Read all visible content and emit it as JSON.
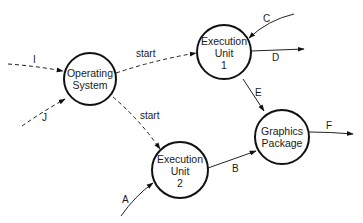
{
  "diagram": {
    "type": "data-flow",
    "colors": {
      "stroke": "#111111",
      "background": "#ffffff",
      "text": "#1a1a1a"
    },
    "nodes": [
      {
        "id": "os",
        "lines": [
          "Operating",
          "System"
        ],
        "cx": 90,
        "cy": 79,
        "r": 26
      },
      {
        "id": "eu1",
        "lines": [
          "Execution",
          "Unit",
          "1"
        ],
        "cx": 224,
        "cy": 52,
        "r": 27
      },
      {
        "id": "eu2",
        "lines": [
          "Execution",
          "Unit",
          "2"
        ],
        "cx": 180,
        "cy": 170,
        "r": 28
      },
      {
        "id": "gp",
        "lines": [
          "Graphics",
          "Package"
        ],
        "cx": 282,
        "cy": 137,
        "r": 27
      }
    ],
    "edges": [
      {
        "id": "I",
        "label": "I",
        "from": "external",
        "to": "os",
        "style": "dashed"
      },
      {
        "id": "J",
        "label": "J",
        "from": "external",
        "to": "os",
        "style": "dashed"
      },
      {
        "id": "start1",
        "label": "start",
        "from": "os",
        "to": "eu1",
        "style": "dashed"
      },
      {
        "id": "start2",
        "label": "start",
        "from": "os",
        "to": "eu2",
        "style": "dashed"
      },
      {
        "id": "C",
        "label": "C",
        "from": "external",
        "to": "eu1",
        "style": "solid"
      },
      {
        "id": "D",
        "label": "D",
        "from": "eu1",
        "to": "external",
        "style": "solid"
      },
      {
        "id": "E",
        "label": "E",
        "from": "eu1",
        "to": "gp",
        "style": "solid"
      },
      {
        "id": "A",
        "label": "A",
        "from": "external",
        "to": "eu2",
        "style": "solid"
      },
      {
        "id": "B",
        "label": "B",
        "from": "eu2",
        "to": "gp",
        "style": "solid"
      },
      {
        "id": "F",
        "label": "F",
        "from": "gp",
        "to": "external",
        "style": "solid"
      }
    ]
  }
}
